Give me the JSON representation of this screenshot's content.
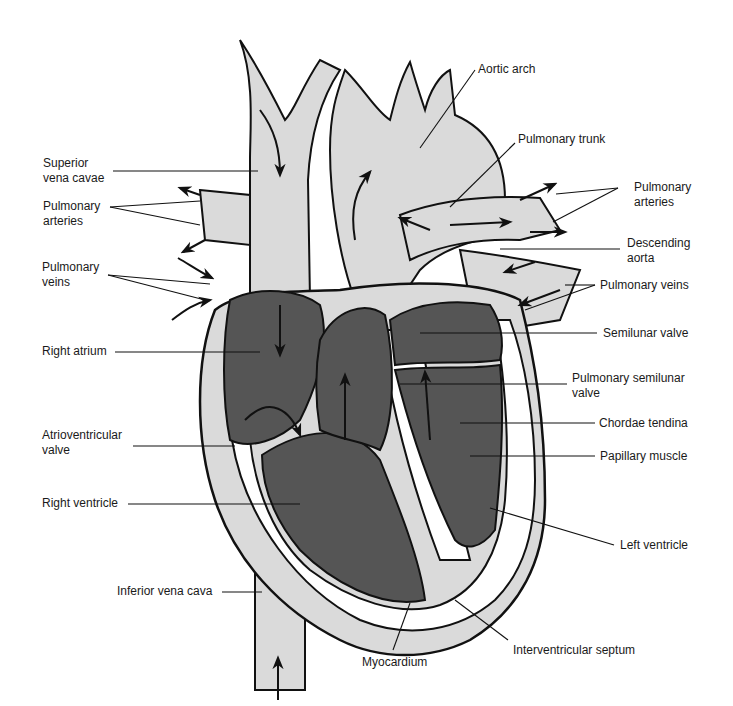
{
  "diagram": {
    "colors": {
      "background": "#ffffff",
      "vessel_fill": "#dadada",
      "chamber_fill": "#555555",
      "outline": "#111111",
      "myocardium_fill": "#ffffff"
    },
    "labels": {
      "superior_vena_cavae": "Superior\nvena cavae",
      "pulmonary_arteries_left": "Pulmonary\narteries",
      "pulmonary_veins_left": "Pulmonary\nveins",
      "right_atrium": "Right atrium",
      "atrioventricular_valve": "Atrioventricular\nvalve",
      "right_ventricle": "Right ventricle",
      "inferior_vena_cava": "Inferior vena cava",
      "aortic_arch": "Aortic arch",
      "pulmonary_trunk": "Pulmonary trunk",
      "pulmonary_arteries_right": "Pulmonary\narteries",
      "descending_aorta": "Descending\naorta",
      "pulmonary_veins_right": "Pulmonary veins",
      "semilunar_valve": "Semilunar valve",
      "pulmonary_semilunar_valve": "Pulmonary semilunar\nvalve",
      "chordae_tendina": "Chordae tendina",
      "papillary_muscle": "Papillary muscle",
      "left_ventricle": "Left ventricle",
      "myocardium": "Myocardium",
      "interventricular_septum": "Interventricular septum"
    }
  }
}
